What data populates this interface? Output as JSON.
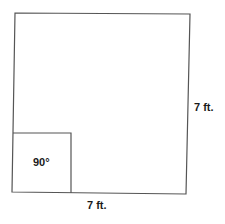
{
  "diagram": {
    "type": "square with right-angle marker",
    "side_right_label": "7 ft.",
    "side_bottom_label": "7 ft.",
    "angle_label": "90°",
    "stroke_color": "#555555",
    "text_color": "#1a1a1a"
  }
}
